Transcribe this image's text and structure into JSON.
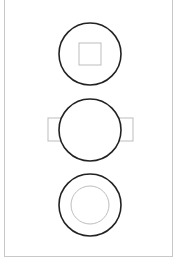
{
  "canvas": {
    "width": 178,
    "height": 262,
    "background": "#ffffff"
  },
  "frame": {
    "border_color": "#c8c8c8"
  },
  "colors": {
    "outer_stroke": "#222222",
    "inner_stroke": "#bdbdbd"
  },
  "shapes": [
    {
      "id": "circle-with-square",
      "outer_circle": {
        "cx": 90,
        "cy": 54,
        "r": 31
      },
      "inner_square": {
        "x": 79,
        "y": 43,
        "w": 22,
        "h": 22
      }
    },
    {
      "id": "circle-with-side-tabs",
      "outer_circle": {
        "cx": 90,
        "cy": 130,
        "r": 31
      },
      "left_tab": {
        "x": 48,
        "y": 118,
        "w": 14,
        "h": 23
      },
      "right_tab": {
        "x": 118,
        "y": 118,
        "w": 15,
        "h": 23
      }
    },
    {
      "id": "ring",
      "outer_circle": {
        "cx": 90,
        "cy": 205,
        "r": 31
      },
      "inner_circle": {
        "cx": 90,
        "cy": 205,
        "r": 19
      }
    }
  ]
}
